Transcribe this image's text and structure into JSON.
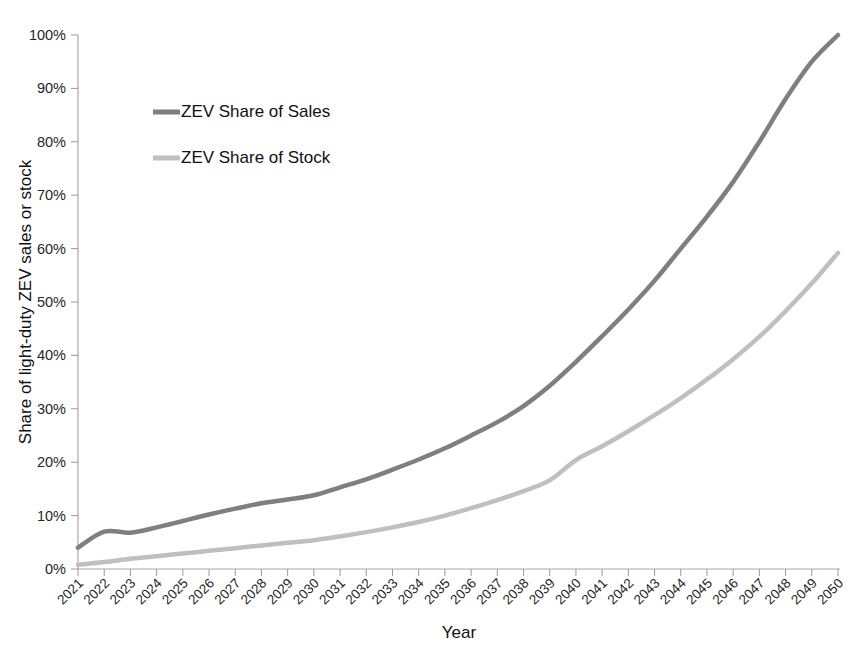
{
  "chart_data": {
    "type": "line",
    "title": "",
    "xlabel": "Year",
    "ylabel": "Share of light-duty ZEV sales or stock",
    "xlim": [
      2021,
      2050
    ],
    "ylim": [
      0,
      1.0
    ],
    "grid": false,
    "legend_position": "upper-left-inside",
    "x": [
      2021,
      2022,
      2023,
      2024,
      2025,
      2026,
      2027,
      2028,
      2029,
      2030,
      2031,
      2032,
      2033,
      2034,
      2035,
      2036,
      2037,
      2038,
      2039,
      2040,
      2041,
      2042,
      2043,
      2044,
      2045,
      2046,
      2047,
      2048,
      2049,
      2050
    ],
    "categories": [
      "2021",
      "2022",
      "2023",
      "2024",
      "2025",
      "2026",
      "2027",
      "2028",
      "2029",
      "2030",
      "2031",
      "2032",
      "2033",
      "2034",
      "2035",
      "2036",
      "2037",
      "2038",
      "2039",
      "2040",
      "2041",
      "2042",
      "2043",
      "2044",
      "2045",
      "2046",
      "2047",
      "2048",
      "2049",
      "2050"
    ],
    "ytick_labels": [
      "0%",
      "10%",
      "20%",
      "30%",
      "40%",
      "50%",
      "60%",
      "70%",
      "80%",
      "90%",
      "100%"
    ],
    "ytick_values": [
      0,
      10,
      20,
      30,
      40,
      50,
      60,
      70,
      80,
      90,
      100
    ],
    "series": [
      {
        "name": "ZEV Share of Sales",
        "color": "#7f7f7f",
        "line_width": 4.5,
        "values": [
          4.0,
          7.0,
          6.8,
          7.8,
          9.0,
          10.2,
          11.3,
          12.3,
          13.0,
          13.8,
          15.3,
          16.8,
          18.6,
          20.5,
          22.6,
          25.0,
          27.5,
          30.5,
          34.3,
          38.8,
          43.6,
          48.6,
          54.0,
          60.0,
          66.0,
          72.5,
          80.0,
          88.0,
          95.0,
          100.0
        ]
      },
      {
        "name": "ZEV Share of Stock",
        "color": "#bfbfbf",
        "line_width": 4.5,
        "values": [
          0.8,
          1.3,
          1.9,
          2.4,
          2.9,
          3.4,
          3.9,
          4.4,
          4.9,
          5.4,
          6.1,
          6.9,
          7.8,
          8.8,
          10.0,
          11.4,
          12.9,
          14.6,
          16.6,
          20.4,
          23.0,
          25.8,
          28.8,
          32.0,
          35.5,
          39.3,
          43.5,
          48.3,
          53.5,
          59.2
        ]
      }
    ],
    "legend": [
      {
        "label": "ZEV Share of Sales",
        "color": "#7f7f7f"
      },
      {
        "label": "ZEV Share of Stock",
        "color": "#bfbfbf"
      }
    ]
  },
  "colors": {
    "sales": "#7f7f7f",
    "stock": "#bfbfbf",
    "axis": "#a8a8a8",
    "text": "#1a1a1a",
    "background": "#ffffff"
  }
}
